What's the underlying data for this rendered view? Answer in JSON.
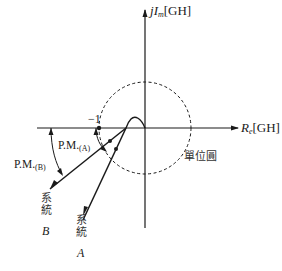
{
  "diagram": {
    "type": "nyquist-plot-phase-margin",
    "axes": {
      "imag_label_prefix": "j",
      "imag_label_var": "I",
      "imag_label_sub": "m",
      "imag_label_unit": "[GH]",
      "real_label_var": "R",
      "real_label_sub": "e",
      "real_label_unit": "[GH]"
    },
    "critical_point_label": "−1",
    "unit_circle_label": "單位圓",
    "phase_margins": [
      {
        "label": "P.M.",
        "sub": "(A)"
      },
      {
        "label": "P.M.",
        "sub": "(B)"
      }
    ],
    "systems": [
      {
        "prefix": "系統",
        "name": "A"
      },
      {
        "prefix": "系統",
        "name": "B"
      }
    ],
    "colors": {
      "line": "#1a1a1a",
      "background": "#ffffff"
    }
  }
}
